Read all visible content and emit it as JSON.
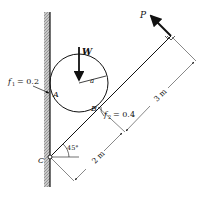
{
  "diagram": {
    "type": "statics-free-body",
    "labels": {
      "force_P": "P",
      "weight_W": "W",
      "radius_a": "a",
      "point_A": "A",
      "point_B": "B",
      "point_C": "C",
      "f1_sym": "f",
      "f1_sub": "1",
      "f1_val": "= 0.2",
      "f2_sym": "f",
      "f2_sub": "2",
      "f2_val": "= 0.4",
      "angle": "45°",
      "dim_2m": "2 m",
      "dim_3m": "3 m"
    },
    "colors": {
      "line": "#111111",
      "wall_hatch": "#9a9a9a",
      "background": "#ffffff"
    }
  }
}
